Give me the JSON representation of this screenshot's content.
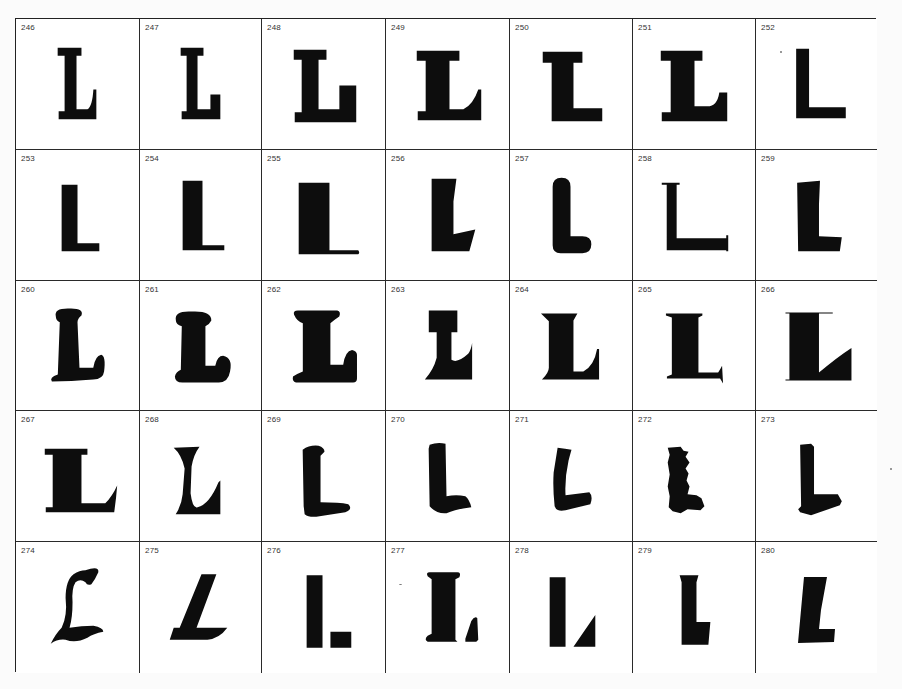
{
  "page": {
    "ink_color": "#0d0d0d",
    "grid_line_color": "#2a2a2a",
    "paper_color": "#ffffff"
  },
  "specimens": [
    {
      "number": "246",
      "style": "slab-serif-bracketed"
    },
    {
      "number": "247",
      "style": "slab-serif-square"
    },
    {
      "number": "248",
      "style": "heavy-slab-serif"
    },
    {
      "number": "249",
      "style": "bold-serif-curved-arm"
    },
    {
      "number": "250",
      "style": "fat-slab-serif"
    },
    {
      "number": "251",
      "style": "bold-clarendon"
    },
    {
      "number": "252",
      "style": "sans-serif-bold"
    },
    {
      "number": "253",
      "style": "grotesque-condensed"
    },
    {
      "number": "254",
      "style": "grotesque-light-arm"
    },
    {
      "number": "255",
      "style": "fat-stem-thin-arm"
    },
    {
      "number": "256",
      "style": "tapered-angular"
    },
    {
      "number": "257",
      "style": "rounded-bold"
    },
    {
      "number": "258",
      "style": "light-serif-spur"
    },
    {
      "number": "259",
      "style": "flared-sans"
    },
    {
      "number": "260",
      "style": "soft-serif-italic"
    },
    {
      "number": "261",
      "style": "cooper-style-bold"
    },
    {
      "number": "262",
      "style": "rounded-slab"
    },
    {
      "number": "263",
      "style": "reverse-contrast"
    },
    {
      "number": "264",
      "style": "bold-wedge-serif"
    },
    {
      "number": "265",
      "style": "bold-spur-serif"
    },
    {
      "number": "266",
      "style": "didone-fat-face"
    },
    {
      "number": "267",
      "style": "bold-roman"
    },
    {
      "number": "268",
      "style": "flared-roman"
    },
    {
      "number": "269",
      "style": "brush-rounded"
    },
    {
      "number": "270",
      "style": "brush-marker"
    },
    {
      "number": "271",
      "style": "brush-script"
    },
    {
      "number": "272",
      "style": "distressed-rough"
    },
    {
      "number": "273",
      "style": "shadowed-brush"
    },
    {
      "number": "274",
      "style": "blackletter"
    },
    {
      "number": "275",
      "style": "slanted-wedge"
    },
    {
      "number": "276",
      "style": "stencil-square"
    },
    {
      "number": "277",
      "style": "tuscan-stencil"
    },
    {
      "number": "278",
      "style": "stencil-triangular"
    },
    {
      "number": "279",
      "style": "condensed-flared"
    },
    {
      "number": "280",
      "style": "oblique-flared"
    }
  ]
}
